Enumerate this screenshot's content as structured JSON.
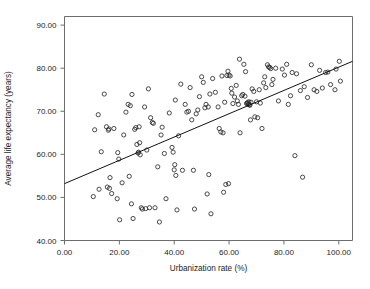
{
  "chart_data": {
    "type": "scatter",
    "title": "",
    "xlabel": "Urbanization rate (%)",
    "ylabel": "Average life expectancy (years)",
    "xlim": [
      0,
      105
    ],
    "ylim": [
      40,
      92
    ],
    "grid": false,
    "legend": "none",
    "xticks": [
      0,
      20,
      40,
      60,
      80,
      100
    ],
    "xtick_labels": [
      "0.00",
      "20.00",
      "40.00",
      "60.00",
      "80.00",
      "100.00"
    ],
    "yticks": [
      40,
      50,
      60,
      70,
      80,
      90
    ],
    "ytick_labels": [
      "40.00",
      "50.00",
      "60.00",
      "70.00",
      "80.00",
      "90.00"
    ],
    "marker": "open-circle",
    "marker_color": "#2a2a2a",
    "frame_color": "#6d6d6d",
    "trendline": {
      "type": "linear",
      "x0": 0,
      "y0": 53.2,
      "x1": 105,
      "y1": 81.6,
      "color": "#111111"
    },
    "points": [
      [
        10.5,
        50.2
      ],
      [
        11.0,
        65.7
      ],
      [
        12.3,
        69.2
      ],
      [
        12.6,
        51.9
      ],
      [
        13.4,
        60.6
      ],
      [
        14.5,
        74.0
      ],
      [
        15.3,
        66.4
      ],
      [
        15.6,
        52.4
      ],
      [
        16.0,
        65.6
      ],
      [
        16.2,
        65.9
      ],
      [
        16.4,
        52.1
      ],
      [
        16.6,
        54.6
      ],
      [
        17.2,
        50.9
      ],
      [
        18.0,
        66.0
      ],
      [
        19.2,
        49.7
      ],
      [
        19.4,
        60.4
      ],
      [
        19.8,
        58.9
      ],
      [
        20.1,
        44.8
      ],
      [
        21.0,
        53.4
      ],
      [
        21.6,
        64.5
      ],
      [
        22.4,
        69.8
      ],
      [
        23.2,
        71.6
      ],
      [
        23.6,
        54.9
      ],
      [
        24.0,
        71.3
      ],
      [
        24.4,
        48.5
      ],
      [
        24.6,
        73.9
      ],
      [
        25.0,
        45.1
      ],
      [
        25.6,
        65.8
      ],
      [
        26.0,
        66.2
      ],
      [
        26.4,
        62.3
      ],
      [
        26.8,
        60.3
      ],
      [
        27.0,
        60.5
      ],
      [
        27.2,
        66.4
      ],
      [
        27.4,
        62.7
      ],
      [
        27.6,
        59.9
      ],
      [
        28.0,
        47.6
      ],
      [
        28.4,
        47.3
      ],
      [
        29.2,
        71.0
      ],
      [
        29.6,
        47.4
      ],
      [
        30.0,
        61.0
      ],
      [
        30.6,
        75.2
      ],
      [
        31.0,
        47.6
      ],
      [
        31.4,
        68.5
      ],
      [
        32.0,
        67.4
      ],
      [
        32.4,
        67.2
      ],
      [
        33.0,
        47.6
      ],
      [
        34.0,
        57.1
      ],
      [
        34.6,
        44.3
      ],
      [
        35.2,
        64.5
      ],
      [
        35.6,
        66.3
      ],
      [
        36.4,
        60.2
      ],
      [
        37.0,
        49.7
      ],
      [
        38.2,
        69.6
      ],
      [
        39.2,
        61.6
      ],
      [
        39.6,
        60.5
      ],
      [
        40.0,
        56.4
      ],
      [
        40.2,
        57.6
      ],
      [
        40.4,
        72.6
      ],
      [
        40.6,
        55.1
      ],
      [
        41.0,
        47.1
      ],
      [
        41.6,
        64.3
      ],
      [
        42.4,
        76.3
      ],
      [
        43.0,
        56.3
      ],
      [
        44.0,
        71.6
      ],
      [
        44.6,
        69.8
      ],
      [
        45.2,
        70.0
      ],
      [
        45.8,
        75.5
      ],
      [
        46.4,
        68.0
      ],
      [
        47.0,
        56.3
      ],
      [
        47.4,
        47.3
      ],
      [
        48.0,
        69.4
      ],
      [
        48.6,
        70.3
      ],
      [
        49.2,
        73.4
      ],
      [
        50.0,
        78.0
      ],
      [
        50.6,
        76.7
      ],
      [
        51.2,
        70.8
      ],
      [
        51.6,
        71.6
      ],
      [
        52.0,
        50.8
      ],
      [
        52.4,
        71.0
      ],
      [
        52.6,
        55.3
      ],
      [
        53.0,
        74.0
      ],
      [
        53.4,
        46.2
      ],
      [
        54.0,
        77.6
      ],
      [
        55.0,
        74.4
      ],
      [
        56.0,
        71.0
      ],
      [
        56.4,
        66.0
      ],
      [
        57.0,
        65.2
      ],
      [
        57.4,
        78.2
      ],
      [
        57.8,
        65.0
      ],
      [
        58.0,
        51.2
      ],
      [
        58.4,
        72.1
      ],
      [
        58.8,
        53.0
      ],
      [
        59.2,
        78.3
      ],
      [
        59.6,
        79.3
      ],
      [
        59.8,
        53.2
      ],
      [
        60.0,
        78.4
      ],
      [
        60.4,
        78.2
      ],
      [
        60.8,
        75.3
      ],
      [
        61.0,
        74.2
      ],
      [
        61.4,
        71.8
      ],
      [
        62.0,
        73.3
      ],
      [
        62.6,
        76.0
      ],
      [
        63.0,
        72.4
      ],
      [
        63.4,
        71.6
      ],
      [
        63.8,
        82.1
      ],
      [
        64.0,
        65.0
      ],
      [
        64.6,
        73.6
      ],
      [
        65.0,
        73.9
      ],
      [
        65.4,
        80.9
      ],
      [
        65.8,
        73.5
      ],
      [
        66.0,
        79.2
      ],
      [
        66.4,
        71.8
      ],
      [
        66.6,
        71.9
      ],
      [
        66.8,
        72.0
      ],
      [
        67.0,
        71.6
      ],
      [
        67.2,
        72.2
      ],
      [
        67.4,
        71.5
      ],
      [
        67.6,
        71.4
      ],
      [
        67.8,
        68.0
      ],
      [
        68.0,
        72.1
      ],
      [
        68.4,
        75.2
      ],
      [
        69.0,
        74.6
      ],
      [
        69.4,
        68.7
      ],
      [
        70.0,
        72.2
      ],
      [
        70.4,
        68.5
      ],
      [
        71.0,
        75.0
      ],
      [
        71.4,
        71.9
      ],
      [
        72.0,
        66.0
      ],
      [
        72.6,
        76.6
      ],
      [
        73.0,
        78.0
      ],
      [
        73.4,
        75.5
      ],
      [
        74.0,
        80.8
      ],
      [
        74.4,
        80.3
      ],
      [
        74.8,
        80.2
      ],
      [
        75.2,
        79.9
      ],
      [
        75.6,
        76.2
      ],
      [
        76.0,
        77.4
      ],
      [
        77.0,
        80.0
      ],
      [
        78.0,
        72.4
      ],
      [
        79.4,
        79.8
      ],
      [
        80.2,
        78.4
      ],
      [
        81.0,
        80.9
      ],
      [
        81.6,
        71.6
      ],
      [
        82.4,
        73.6
      ],
      [
        83.0,
        79.0
      ],
      [
        84.0,
        59.7
      ],
      [
        84.6,
        78.7
      ],
      [
        86.0,
        74.8
      ],
      [
        86.8,
        54.7
      ],
      [
        87.4,
        75.7
      ],
      [
        88.6,
        73.2
      ],
      [
        90.0,
        80.8
      ],
      [
        91.0,
        75.0
      ],
      [
        92.0,
        74.6
      ],
      [
        93.0,
        79.5
      ],
      [
        94.0,
        75.4
      ],
      [
        95.2,
        79.0
      ],
      [
        96.0,
        79.1
      ],
      [
        97.0,
        76.2
      ],
      [
        98.6,
        75.0
      ],
      [
        99.0,
        79.8
      ],
      [
        100.2,
        81.6
      ],
      [
        100.6,
        77.0
      ]
    ]
  }
}
